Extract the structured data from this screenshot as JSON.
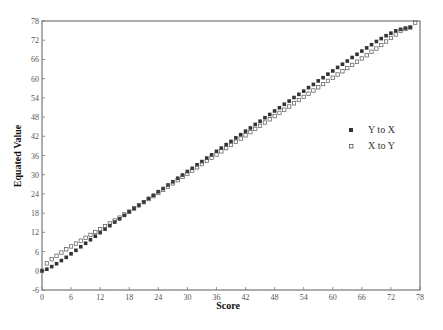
{
  "chart_data": {
    "type": "scatter",
    "title": "",
    "xlabel": "Score",
    "ylabel": "Equated Value",
    "xlim": [
      0,
      78
    ],
    "ylim": [
      -6,
      78
    ],
    "x_ticks": [
      0,
      6,
      12,
      18,
      24,
      30,
      36,
      42,
      48,
      54,
      60,
      66,
      72,
      78
    ],
    "y_ticks": [
      -6,
      0,
      6,
      12,
      18,
      24,
      30,
      36,
      42,
      48,
      54,
      60,
      66,
      72,
      78
    ],
    "grid": false,
    "legend_position": "right-middle",
    "series": [
      {
        "name": "Y to X",
        "marker": "filled-square",
        "x": [
          0,
          1,
          2,
          3,
          4,
          5,
          6,
          7,
          8,
          9,
          10,
          11,
          12,
          13,
          14,
          15,
          16,
          17,
          18,
          19,
          20,
          21,
          22,
          23,
          24,
          25,
          26,
          27,
          28,
          29,
          30,
          31,
          32,
          33,
          34,
          35,
          36,
          37,
          38,
          39,
          40,
          41,
          42,
          43,
          44,
          45,
          46,
          47,
          48,
          49,
          50,
          51,
          52,
          53,
          54,
          55,
          56,
          57,
          58,
          59,
          60,
          61,
          62,
          63,
          64,
          65,
          66,
          67,
          68,
          69,
          70,
          71,
          72,
          73,
          74,
          75,
          76
        ],
        "values": [
          0,
          0.5,
          1.3,
          2.2,
          3.2,
          4.2,
          5.3,
          6.4,
          7.5,
          8.6,
          9.7,
          10.8,
          11.9,
          13.0,
          14.1,
          15.2,
          16.2,
          17.3,
          18.4,
          19.4,
          20.5,
          21.5,
          22.6,
          23.6,
          24.7,
          25.7,
          26.8,
          27.8,
          28.9,
          29.9,
          31.0,
          32.0,
          33.1,
          34.1,
          35.2,
          36.2,
          37.3,
          38.3,
          39.4,
          40.4,
          41.5,
          42.5,
          43.6,
          44.6,
          45.7,
          46.7,
          47.8,
          48.8,
          49.9,
          50.9,
          52.0,
          53.0,
          54.1,
          55.1,
          56.1,
          57.2,
          58.2,
          59.3,
          60.3,
          61.4,
          62.4,
          63.5,
          64.5,
          65.5,
          66.6,
          67.6,
          68.6,
          69.6,
          70.6,
          71.6,
          72.5,
          73.4,
          74.2,
          74.9,
          75.4,
          75.8,
          76.0
        ]
      },
      {
        "name": "X to Y",
        "marker": "open-square",
        "x": [
          0,
          1,
          2,
          3,
          4,
          5,
          6,
          7,
          8,
          9,
          10,
          11,
          12,
          13,
          14,
          15,
          16,
          17,
          18,
          19,
          20,
          21,
          22,
          23,
          24,
          25,
          26,
          27,
          28,
          29,
          30,
          31,
          32,
          33,
          34,
          35,
          36,
          37,
          38,
          39,
          40,
          41,
          42,
          43,
          44,
          45,
          46,
          47,
          48,
          49,
          50,
          51,
          52,
          53,
          54,
          55,
          56,
          57,
          58,
          59,
          60,
          61,
          62,
          63,
          64,
          65,
          66,
          67,
          68,
          69,
          70,
          71,
          72,
          73,
          74,
          75,
          76,
          77
        ],
        "values": [
          0,
          2.3,
          3.6,
          4.7,
          5.7,
          6.7,
          7.6,
          8.5,
          9.4,
          10.3,
          11.2,
          12.1,
          13.0,
          13.9,
          14.8,
          15.7,
          16.6,
          17.6,
          18.5,
          19.5,
          20.4,
          21.4,
          22.4,
          23.3,
          24.3,
          25.3,
          26.3,
          27.3,
          28.3,
          29.3,
          30.3,
          31.3,
          32.3,
          33.3,
          34.3,
          35.3,
          36.3,
          37.3,
          38.3,
          39.3,
          40.3,
          41.3,
          42.3,
          43.3,
          44.3,
          45.3,
          46.3,
          47.3,
          48.3,
          49.3,
          50.3,
          51.3,
          52.3,
          53.3,
          54.3,
          55.3,
          56.3,
          57.3,
          58.3,
          59.3,
          60.3,
          61.3,
          62.3,
          63.3,
          64.3,
          65.3,
          66.3,
          67.3,
          68.4,
          69.4,
          70.5,
          71.6,
          72.7,
          73.8,
          74.9,
          75.5,
          76.0,
          77.5
        ]
      }
    ]
  },
  "legend": {
    "items": [
      {
        "label": "Y to X"
      },
      {
        "label": "X to Y"
      }
    ]
  },
  "axes": {
    "x_title": "Score",
    "y_title": "Equated Value"
  },
  "colors": {
    "axis": "#777777",
    "filled_marker": "#333333",
    "open_marker": "#555555",
    "text": "#222222"
  }
}
